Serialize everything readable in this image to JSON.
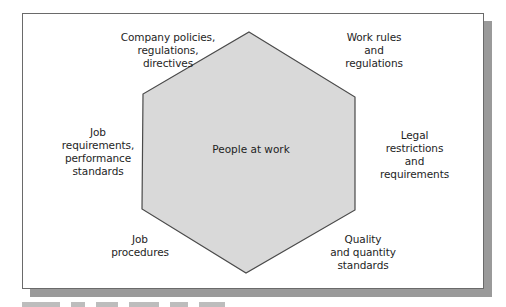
{
  "diagram": {
    "type": "hexagon-influences",
    "center": {
      "label": "People at work"
    },
    "hexagon": {
      "fill": "#d9d9d9",
      "stroke": "#4a4a4a",
      "vertices": [
        [
          249,
          32
        ],
        [
          355,
          97
        ],
        [
          355,
          210
        ],
        [
          246,
          273
        ],
        [
          142,
          209
        ],
        [
          143,
          94
        ]
      ]
    },
    "influences": [
      {
        "position": "top-left",
        "label": "Company policies,\nregulations,\ndirectives"
      },
      {
        "position": "top-right",
        "label": "Work rules\nand\nregulations"
      },
      {
        "position": "right",
        "label": "Legal\nrestrictions\nand\nrequirements"
      },
      {
        "position": "bottom-right",
        "label": "Quality\nand quantity\nstandards"
      },
      {
        "position": "bottom-left",
        "label": "Job\nprocedures"
      },
      {
        "position": "left",
        "label": "Job\nrequirements,\nperformance\nstandards"
      }
    ]
  },
  "frame": {
    "border_color": "#6a6a6a",
    "shadow_color": "#9a9a9a",
    "background": "#ffffff"
  },
  "caption": {
    "visible": "clipped",
    "color": "#bdbdbd"
  }
}
